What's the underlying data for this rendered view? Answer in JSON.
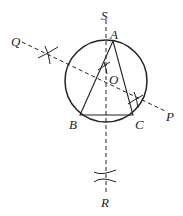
{
  "diagram": {
    "type": "geometry-construction",
    "labels": {
      "S": "S",
      "Q": "Q",
      "A": "A",
      "O": "O",
      "B": "B",
      "C": "C",
      "P": "P",
      "R": "R"
    },
    "colors": {
      "stroke": "#222222",
      "background": "#ffffff"
    }
  }
}
